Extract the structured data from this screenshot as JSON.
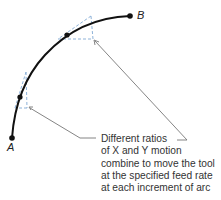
{
  "diagram": {
    "points": [
      {
        "id": "A",
        "label": "A"
      },
      {
        "id": "B",
        "label": "B"
      }
    ],
    "caption": {
      "lines": [
        "Different ratios",
        "of X and Y motion",
        "combine to move the tool",
        "at the specified feed rate",
        "at each increment of arc"
      ]
    },
    "colors": {
      "arc": "#111111",
      "dashed": "#8fb3d9",
      "leader": "#777777"
    }
  }
}
